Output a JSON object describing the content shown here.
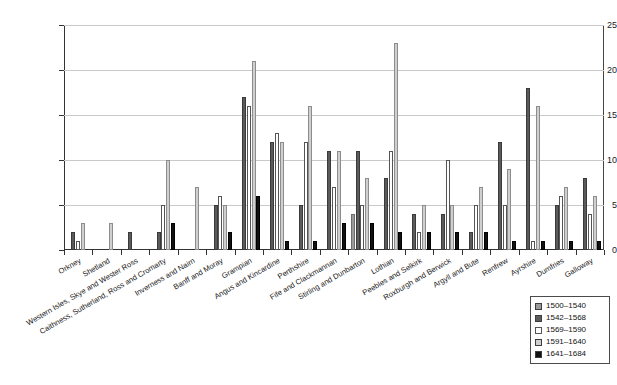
{
  "chart_data": {
    "type": "bar",
    "title": "",
    "xlabel": "",
    "ylabel": "",
    "ylim": [
      0,
      25
    ],
    "yticks": [
      0,
      5,
      10,
      15,
      20,
      25
    ],
    "grid": true,
    "legend_position": "bottom-right",
    "categories": [
      "Orkney",
      "Shetland",
      "Western Isles, Skye and Wester Ross",
      "Caithness, Sutherland, Ross and Cromarty",
      "Inverness and Nairn",
      "Banff and Moray",
      "Grampian",
      "Angus and Kincardine",
      "Perthshire",
      "Fife and Clackmannan",
      "Stirling and Dunbarton",
      "Lothian",
      "Peebles and Selkirk",
      "Roxburgh and Berwick",
      "Argyll and Bute",
      "Renfrew",
      "Ayrshire",
      "Dumfries",
      "Galloway"
    ],
    "series": [
      {
        "name": "1500-1540",
        "color": "#9a9a9a",
        "values": [
          0,
          0,
          0,
          0,
          0,
          0,
          0,
          0,
          0,
          0,
          4,
          0,
          0,
          0,
          0,
          0,
          0,
          0,
          0
        ]
      },
      {
        "name": "1542-1568",
        "color": "#5b5b5b",
        "values": [
          2,
          0,
          2,
          2,
          0,
          5,
          17,
          12,
          5,
          11,
          11,
          8,
          4,
          4,
          2,
          12,
          18,
          5,
          8
        ]
      },
      {
        "name": "1569-1590",
        "color": "#ffffff",
        "values": [
          1,
          0,
          0,
          5,
          0,
          6,
          16,
          13,
          12,
          7,
          5,
          11,
          2,
          10,
          5,
          5,
          1,
          6,
          4
        ]
      },
      {
        "name": "1591-1640",
        "color": "#cfcfcf",
        "values": [
          3,
          3,
          0,
          10,
          7,
          5,
          21,
          12,
          16,
          11,
          8,
          23,
          5,
          5,
          7,
          9,
          16,
          7,
          6
        ]
      },
      {
        "name": "1641-1684",
        "color": "#111111",
        "values": [
          0,
          0,
          0,
          3,
          0,
          2,
          6,
          1,
          1,
          3,
          3,
          2,
          2,
          2,
          2,
          1,
          1,
          1,
          1
        ]
      }
    ],
    "legend_entries": [
      {
        "label": "1500-1540",
        "color": "#9a9a9a"
      },
      {
        "label": "1542-1568",
        "color": "#5b5b5b"
      },
      {
        "label": "1569-1590",
        "color": "#ffffff"
      },
      {
        "label": "1591-1640",
        "color": "#cfcfcf"
      },
      {
        "label": "1641-1684",
        "color": "#111111"
      }
    ]
  }
}
